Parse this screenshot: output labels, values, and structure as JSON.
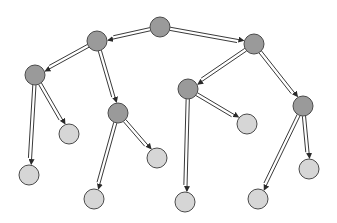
{
  "diagram": {
    "type": "tree",
    "width": 337,
    "height": 223,
    "colors": {
      "background": "#ffffff",
      "internal_node_fill": "#9a9a9a",
      "leaf_node_fill": "#d6d6d6",
      "node_stroke": "#4a4a4a",
      "edge_stroke": "#3a3a3a"
    },
    "node_radius": 10,
    "nodes": [
      {
        "id": "n0",
        "x": 160,
        "y": 27,
        "kind": "internal"
      },
      {
        "id": "n1",
        "x": 97,
        "y": 41,
        "kind": "internal"
      },
      {
        "id": "n2",
        "x": 254,
        "y": 44,
        "kind": "internal"
      },
      {
        "id": "n3",
        "x": 35,
        "y": 75,
        "kind": "internal"
      },
      {
        "id": "n4",
        "x": 118,
        "y": 113,
        "kind": "internal"
      },
      {
        "id": "n5",
        "x": 188,
        "y": 89,
        "kind": "internal"
      },
      {
        "id": "n6",
        "x": 303,
        "y": 106,
        "kind": "internal"
      },
      {
        "id": "n7",
        "x": 29,
        "y": 175,
        "kind": "leaf"
      },
      {
        "id": "n8",
        "x": 69,
        "y": 134,
        "kind": "leaf"
      },
      {
        "id": "n9",
        "x": 94,
        "y": 199,
        "kind": "leaf"
      },
      {
        "id": "n10",
        "x": 157,
        "y": 158,
        "kind": "leaf"
      },
      {
        "id": "n11",
        "x": 185,
        "y": 202,
        "kind": "leaf"
      },
      {
        "id": "n12",
        "x": 247,
        "y": 124,
        "kind": "leaf"
      },
      {
        "id": "n13",
        "x": 258,
        "y": 199,
        "kind": "leaf"
      },
      {
        "id": "n14",
        "x": 309,
        "y": 169,
        "kind": "leaf"
      }
    ],
    "edges": [
      {
        "from": "n0",
        "to": "n1"
      },
      {
        "from": "n0",
        "to": "n2"
      },
      {
        "from": "n1",
        "to": "n3"
      },
      {
        "from": "n1",
        "to": "n4"
      },
      {
        "from": "n2",
        "to": "n5"
      },
      {
        "from": "n2",
        "to": "n6"
      },
      {
        "from": "n3",
        "to": "n7"
      },
      {
        "from": "n3",
        "to": "n8"
      },
      {
        "from": "n4",
        "to": "n9"
      },
      {
        "from": "n4",
        "to": "n10"
      },
      {
        "from": "n5",
        "to": "n11"
      },
      {
        "from": "n5",
        "to": "n12"
      },
      {
        "from": "n6",
        "to": "n13"
      },
      {
        "from": "n6",
        "to": "n14"
      }
    ]
  }
}
